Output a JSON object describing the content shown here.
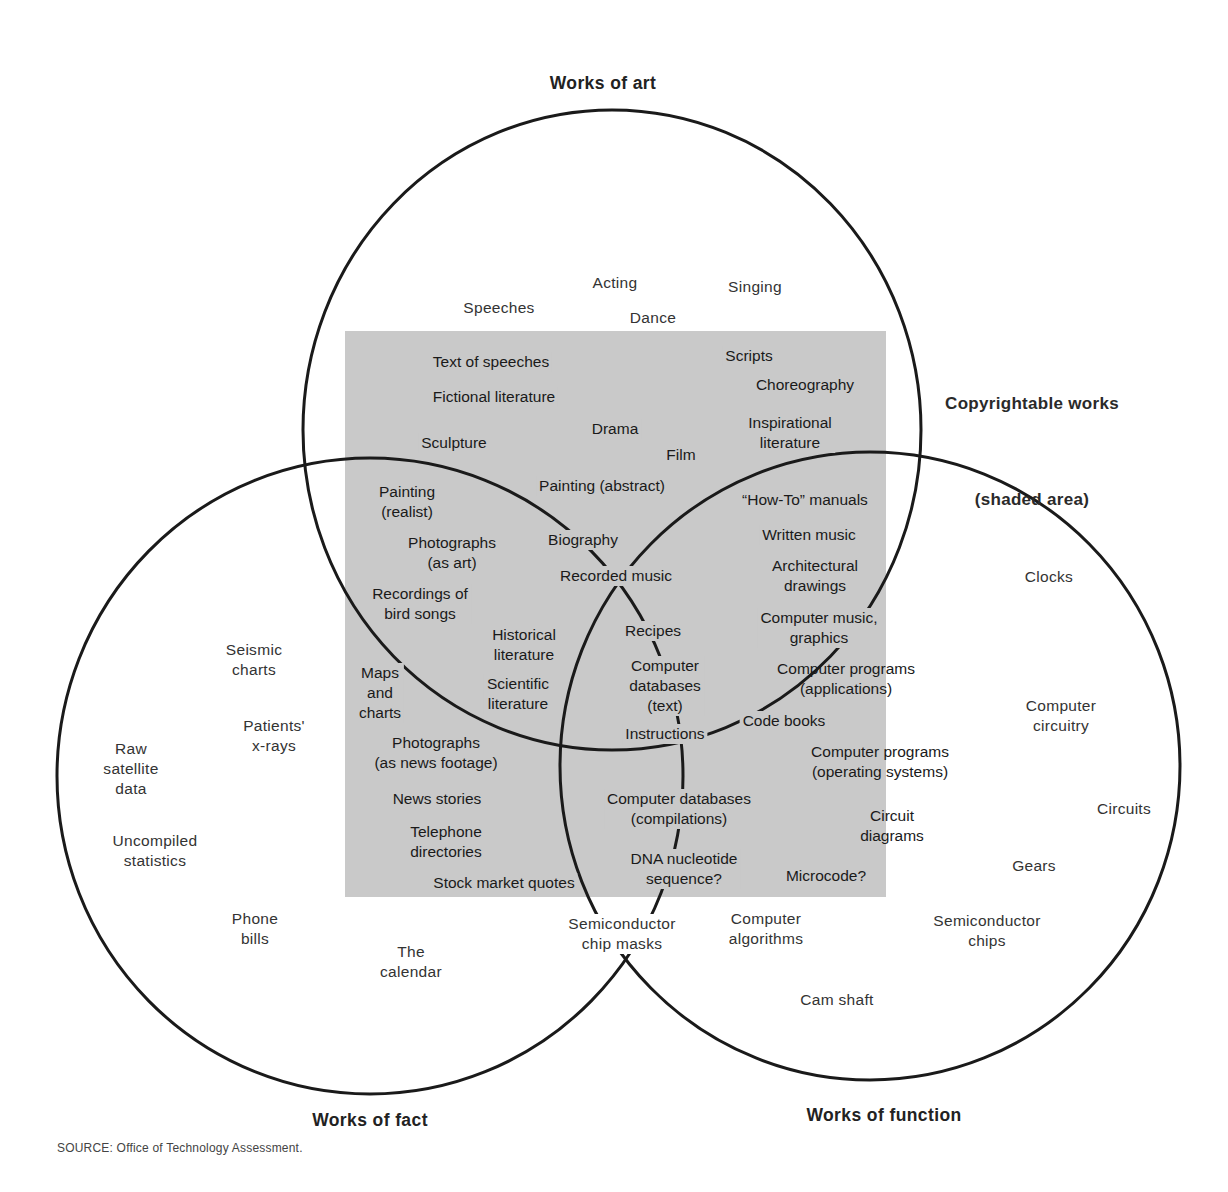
{
  "diagram": {
    "colors": {
      "shade": "#c9c9c9",
      "line": "#1a1a1a",
      "background": "#ffffff"
    },
    "circles": [
      {
        "id": "art",
        "title": "Works of art",
        "cx": 612,
        "cy": 430,
        "rx": 309,
        "ry": 320
      },
      {
        "id": "fact",
        "title": "Works of fact",
        "cx": 370,
        "cy": 776,
        "rx": 313,
        "ry": 318
      },
      {
        "id": "function",
        "title": "Works of function",
        "cx": 870,
        "cy": 766,
        "rx": 310,
        "ry": 314
      }
    ],
    "titles": {
      "art": "Works of art",
      "fact": "Works of fact",
      "function": "Works of function"
    },
    "legend": {
      "line1": "Copyrightable works",
      "line2": "(shaded area)"
    },
    "source": "SOURCE: Office of Technology Assessment.",
    "labels": [
      {
        "text": "Speeches",
        "x": 499,
        "y": 298,
        "zone": "out"
      },
      {
        "text": "Acting",
        "x": 615,
        "y": 273,
        "zone": "out"
      },
      {
        "text": "Singing",
        "x": 755,
        "y": 277,
        "zone": "out"
      },
      {
        "text": "Dance",
        "x": 653,
        "y": 308,
        "zone": "out"
      },
      {
        "text": "Text of speeches",
        "x": 491,
        "y": 352,
        "zone": "in"
      },
      {
        "text": "Scripts",
        "x": 749,
        "y": 346,
        "zone": "in"
      },
      {
        "text": "Choreography",
        "x": 805,
        "y": 375,
        "zone": "in"
      },
      {
        "text": "Fictional literature",
        "x": 494,
        "y": 387,
        "zone": "in"
      },
      {
        "text": "Inspirational\nliterature",
        "x": 790,
        "y": 413,
        "zone": "in"
      },
      {
        "text": "Drama",
        "x": 615,
        "y": 419,
        "zone": "in"
      },
      {
        "text": "Sculpture",
        "x": 454,
        "y": 433,
        "zone": "in"
      },
      {
        "text": "Film",
        "x": 681,
        "y": 445,
        "zone": "in"
      },
      {
        "text": "Painting (abstract)",
        "x": 602,
        "y": 476,
        "zone": "in"
      },
      {
        "text": "Painting\n(realist)",
        "x": 407,
        "y": 482,
        "zone": "in"
      },
      {
        "text": "“How-To” manuals",
        "x": 805,
        "y": 490,
        "zone": "in"
      },
      {
        "text": "Photographs\n(as art)",
        "x": 452,
        "y": 533,
        "zone": "in"
      },
      {
        "text": "Biography",
        "x": 583,
        "y": 530,
        "zone": "in"
      },
      {
        "text": "Written music",
        "x": 809,
        "y": 525,
        "zone": "in"
      },
      {
        "text": "Architectural\ndrawings",
        "x": 815,
        "y": 556,
        "zone": "in"
      },
      {
        "text": "Recorded music",
        "x": 616,
        "y": 566,
        "zone": "in"
      },
      {
        "text": "Recordings of\nbird songs",
        "x": 420,
        "y": 584,
        "zone": "in"
      },
      {
        "text": "Computer music,\ngraphics",
        "x": 819,
        "y": 608,
        "zone": "in"
      },
      {
        "text": "Recipes",
        "x": 653,
        "y": 621,
        "zone": "in"
      },
      {
        "text": "Historical\nliterature",
        "x": 524,
        "y": 625,
        "zone": "in"
      },
      {
        "text": "Computer\ndatabases\n(text)",
        "x": 665,
        "y": 656,
        "zone": "in"
      },
      {
        "text": "Computer programs\n(applications)",
        "x": 846,
        "y": 659,
        "zone": "in",
        "spill": true
      },
      {
        "text": "Maps\nand\ncharts",
        "x": 380,
        "y": 663,
        "zone": "in"
      },
      {
        "text": "Scientific\nliterature",
        "x": 518,
        "y": 674,
        "zone": "in"
      },
      {
        "text": "Code books",
        "x": 784,
        "y": 711,
        "zone": "in"
      },
      {
        "text": "Instructions",
        "x": 665,
        "y": 724,
        "zone": "in"
      },
      {
        "text": "Photographs\n(as news footage)",
        "x": 436,
        "y": 733,
        "zone": "in"
      },
      {
        "text": "Computer programs\n(operating systems)",
        "x": 880,
        "y": 742,
        "zone": "in",
        "spill": true
      },
      {
        "text": "News stories",
        "x": 437,
        "y": 789,
        "zone": "in"
      },
      {
        "text": "Computer databases\n(compilations)",
        "x": 679,
        "y": 789,
        "zone": "in"
      },
      {
        "text": "Circuit\ndiagrams",
        "x": 892,
        "y": 806,
        "zone": "in",
        "spill": true
      },
      {
        "text": "Telephone\ndirectories",
        "x": 446,
        "y": 822,
        "zone": "in"
      },
      {
        "text": "DNA nucleotide\nsequence?",
        "x": 684,
        "y": 849,
        "zone": "in"
      },
      {
        "text": "Microcode?",
        "x": 826,
        "y": 866,
        "zone": "in"
      },
      {
        "text": "Stock market quotes",
        "x": 504,
        "y": 873,
        "zone": "in"
      },
      {
        "text": "Semiconductor\nchip masks",
        "x": 622,
        "y": 914,
        "zone": "out"
      },
      {
        "text": "Computer\nalgorithms",
        "x": 766,
        "y": 909,
        "zone": "out"
      },
      {
        "text": "Semiconductor\nchips",
        "x": 987,
        "y": 911,
        "zone": "out"
      },
      {
        "text": "Cam shaft",
        "x": 837,
        "y": 990,
        "zone": "out"
      },
      {
        "text": "Clocks",
        "x": 1049,
        "y": 567,
        "zone": "out"
      },
      {
        "text": "Computer\ncircuitry",
        "x": 1061,
        "y": 696,
        "zone": "out"
      },
      {
        "text": "Circuits",
        "x": 1124,
        "y": 799,
        "zone": "out"
      },
      {
        "text": "Gears",
        "x": 1034,
        "y": 856,
        "zone": "out"
      },
      {
        "text": "Seismic\ncharts",
        "x": 254,
        "y": 640,
        "zone": "out"
      },
      {
        "text": "Patients'\nx-rays",
        "x": 274,
        "y": 716,
        "zone": "out"
      },
      {
        "text": "Raw\nsatellite\ndata",
        "x": 131,
        "y": 739,
        "zone": "out"
      },
      {
        "text": "Uncompiled\nstatistics",
        "x": 155,
        "y": 831,
        "zone": "out"
      },
      {
        "text": "Phone\nbills",
        "x": 255,
        "y": 909,
        "zone": "out"
      },
      {
        "text": "The\ncalendar",
        "x": 411,
        "y": 942,
        "zone": "out"
      }
    ]
  }
}
